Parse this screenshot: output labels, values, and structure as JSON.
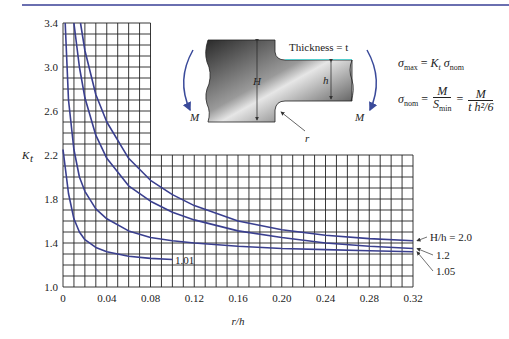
{
  "chart_data": {
    "type": "line",
    "title": "",
    "xlabel": "r/h",
    "ylabel": "K_t",
    "xlim": [
      0,
      0.32
    ],
    "ylim": [
      1.0,
      3.4
    ],
    "grid": true,
    "x_ticks": [
      "0",
      "0.04",
      "0.08",
      "0.12",
      "0.16",
      "0.20",
      "0.24",
      "0.28",
      "0.32"
    ],
    "y_ticks": [
      "1.0",
      "1.4",
      "1.8",
      "2.2",
      "2.6",
      "3.0",
      "3.4"
    ],
    "series": [
      {
        "name": "H/h = 2.0",
        "x": [
          0.016,
          0.02,
          0.03,
          0.04,
          0.06,
          0.08,
          0.1,
          0.12,
          0.16,
          0.2,
          0.24,
          0.28,
          0.32
        ],
        "y": [
          3.4,
          3.15,
          2.75,
          2.5,
          2.17,
          1.97,
          1.84,
          1.74,
          1.6,
          1.52,
          1.47,
          1.44,
          1.42
        ]
      },
      {
        "name": "1.2",
        "x": [
          0.01,
          0.015,
          0.02,
          0.03,
          0.04,
          0.06,
          0.08,
          0.1,
          0.12,
          0.16,
          0.2,
          0.24,
          0.28,
          0.32
        ],
        "y": [
          3.4,
          3.0,
          2.72,
          2.38,
          2.17,
          1.92,
          1.78,
          1.68,
          1.61,
          1.51,
          1.45,
          1.4,
          1.37,
          1.35
        ]
      },
      {
        "name": "1.05",
        "x": [
          0.002,
          0.005,
          0.01,
          0.015,
          0.02,
          0.03,
          0.04,
          0.06,
          0.08,
          0.1,
          0.12,
          0.16,
          0.2,
          0.24,
          0.28,
          0.32
        ],
        "y": [
          3.4,
          2.7,
          2.25,
          2.0,
          1.87,
          1.71,
          1.62,
          1.51,
          1.45,
          1.42,
          1.4,
          1.37,
          1.35,
          1.34,
          1.33,
          1.32
        ]
      },
      {
        "name": "1.01",
        "x": [
          0.0,
          0.005,
          0.01,
          0.015,
          0.02,
          0.03,
          0.04,
          0.06,
          0.08,
          0.1
        ],
        "y": [
          2.25,
          1.85,
          1.62,
          1.5,
          1.43,
          1.36,
          1.32,
          1.28,
          1.26,
          1.25
        ]
      }
    ],
    "annotations": [
      "H/h = 2.0",
      "1.2",
      "1.05",
      "1.01"
    ]
  },
  "diagram": {
    "thickness_label": "Thickness = t",
    "H_label": "H",
    "h_label": "h",
    "r_label": "r",
    "moment_left": "M",
    "moment_right": "M"
  },
  "formulas": {
    "sigma": "σ",
    "max_sub": "max",
    "nom_sub": "nom",
    "min_sub": "min",
    "Kt": "K",
    "t_sub": "t",
    "M": "M",
    "S": "S",
    "den2": "t h²/6",
    "eq": "="
  }
}
